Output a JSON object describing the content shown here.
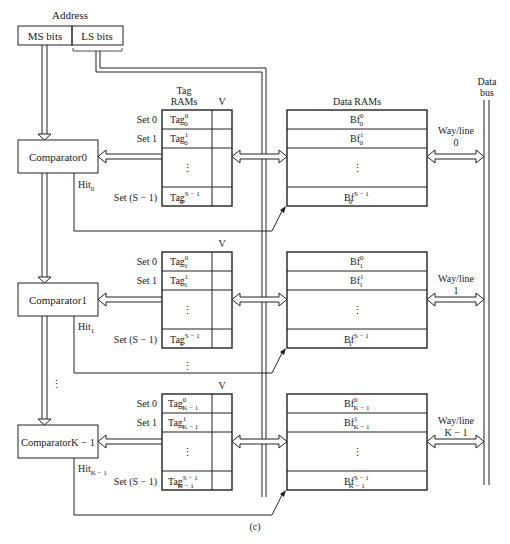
{
  "address": {
    "label": "Address",
    "ms_bits": "MS bits",
    "ls_bits": "LS bits"
  },
  "tag_header": {
    "line1": "Tag",
    "line2": "RAMs",
    "valid": "V"
  },
  "data_header": "Data RAMs",
  "data_bus": {
    "line1": "Data",
    "line2": "bus"
  },
  "sets": [
    "Set 0",
    "Set 1",
    "Set (S − 1)"
  ],
  "ellipsis": "⋮",
  "ways": [
    {
      "comparator": "Comparator0",
      "hit": "Hit",
      "hit_sub": "0",
      "tag_sub": "0",
      "tags": [
        {
          "base": "Tag",
          "sup": "0"
        },
        {
          "base": "Tag",
          "sup": "1"
        },
        {
          "base": "Tag",
          "sup": "S − 1"
        }
      ],
      "blocks": [
        {
          "base": "Bf",
          "sup": "0"
        },
        {
          "base": "Bf",
          "sup": "1"
        },
        {
          "base": "Bf",
          "sup": "S − 1"
        }
      ],
      "way_label": {
        "line1": "Way/line",
        "line2": "0"
      }
    },
    {
      "comparator": "Comparator1",
      "hit": "Hit",
      "hit_sub": "1",
      "tag_sub": "1",
      "tags": [
        {
          "base": "Tag",
          "sup": "0"
        },
        {
          "base": "Tag",
          "sup": "1"
        },
        {
          "base": "Tag",
          "sup": "S − 1"
        }
      ],
      "blocks": [
        {
          "base": "Bf",
          "sup": "0"
        },
        {
          "base": "Bf",
          "sup": "1"
        },
        {
          "base": "Bf",
          "sup": "S − 1"
        }
      ],
      "way_label": {
        "line1": "Way/line",
        "line2": "1"
      }
    },
    {
      "comparator": "ComparatorK − 1",
      "hit": "Hit",
      "hit_sub": "K − 1",
      "tag_sub": "K − 1",
      "tags": [
        {
          "base": "Tag",
          "sup": "0"
        },
        {
          "base": "Tag",
          "sup": "1"
        },
        {
          "base": "Tag",
          "sup": "S − 1"
        }
      ],
      "blocks": [
        {
          "base": "Bf",
          "sup": "0"
        },
        {
          "base": "Bf",
          "sup": "1"
        },
        {
          "base": "Bf",
          "sup": "S − 1"
        }
      ],
      "way_label": {
        "line1": "Way/line",
        "line2": "K − 1"
      }
    }
  ],
  "caption": "(c)"
}
